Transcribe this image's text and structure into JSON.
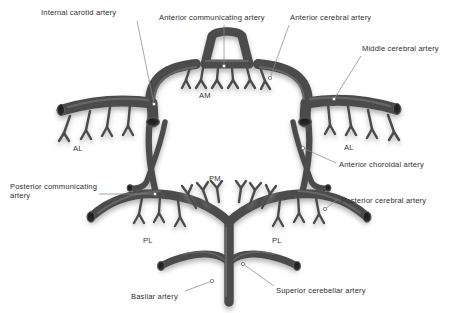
{
  "figure": {
    "width": 458,
    "height": 313,
    "background_color": "#ffffff",
    "vessel_color": "#4c4c4c",
    "vessel_shadow_color": "#b8b8b8",
    "label_color": "#2e2e2e",
    "leader_line_color": "#8a8a8a"
  },
  "callout_labels": [
    {
      "key": "internal_carotid_artery",
      "text": "Internal carotid artery",
      "x": 41,
      "y": 8,
      "align": "left",
      "leader": {
        "x1": 137,
        "y1": 21,
        "x2": 154,
        "y2": 104,
        "dot": true
      }
    },
    {
      "key": "anterior_communicating_artery",
      "text": "Anterior communicating artery",
      "x": 159,
      "y": 13,
      "align": "left",
      "leader": {
        "x1": 224,
        "y1": 25,
        "x2": 224,
        "y2": 66,
        "dot": true
      }
    },
    {
      "key": "anterior_cerebral_artery",
      "text": "Anterior cerebral artery",
      "x": 290,
      "y": 13,
      "align": "left",
      "leader": {
        "x1": 289,
        "y1": 25,
        "x2": 270,
        "y2": 78,
        "dot": true
      }
    },
    {
      "key": "middle_cerebral_artery",
      "text": "Middle cerebral artery",
      "x": 362,
      "y": 44,
      "align": "left",
      "leader": {
        "x1": 361,
        "y1": 56,
        "x2": 334,
        "y2": 99,
        "dot": true
      }
    },
    {
      "key": "anterior_choroidal_artery",
      "text": "Anterior choroidal artery",
      "x": 339,
      "y": 160,
      "align": "left",
      "leader": {
        "x1": 336,
        "y1": 163,
        "x2": 303,
        "y2": 148,
        "dot": true
      }
    },
    {
      "key": "posterior_communicating_artery",
      "text": "Posterior communicating\nartery",
      "x": 10,
      "y": 182,
      "align": "left",
      "leader": {
        "x1": 99,
        "y1": 194,
        "x2": 155,
        "y2": 194,
        "dot": true
      }
    },
    {
      "key": "posterior_cerebral_artery",
      "text": "Posterior cerebral artery",
      "x": 341,
      "y": 196,
      "align": "left",
      "leader": {
        "x1": 338,
        "y1": 199,
        "x2": 325,
        "y2": 209,
        "dot": true
      }
    },
    {
      "key": "basilar_artery",
      "text": "Basilar artery",
      "x": 131,
      "y": 292,
      "align": "left",
      "leader": {
        "x1": 185,
        "y1": 291,
        "x2": 212,
        "y2": 281,
        "dot": true
      }
    },
    {
      "key": "superior_cerebellar_artery",
      "text": "Superior cerebellar artery",
      "x": 276,
      "y": 286,
      "align": "left",
      "leader": {
        "x1": 274,
        "y1": 286,
        "x2": 243,
        "y2": 264,
        "dot": true
      }
    }
  ],
  "inline_labels": [
    {
      "key": "am",
      "text": "AM",
      "x": 199,
      "y": 91,
      "meaning": "anteromedial central (perforating) arteries"
    },
    {
      "key": "al_left",
      "text": "AL",
      "x": 73,
      "y": 144,
      "meaning": "anterolateral central (perforating) arteries"
    },
    {
      "key": "al_right",
      "text": "AL",
      "x": 344,
      "y": 143,
      "meaning": "anterolateral central (perforating) arteries"
    },
    {
      "key": "pm",
      "text": "PM",
      "x": 209,
      "y": 174,
      "meaning": "posteromedial central (perforating) arteries"
    },
    {
      "key": "pl_left",
      "text": "PL",
      "x": 143,
      "y": 236,
      "meaning": "posterolateral central (perforating) arteries"
    },
    {
      "key": "pl_right",
      "text": "PL",
      "x": 272,
      "y": 236,
      "meaning": "posterolateral central (perforating) arteries"
    }
  ]
}
